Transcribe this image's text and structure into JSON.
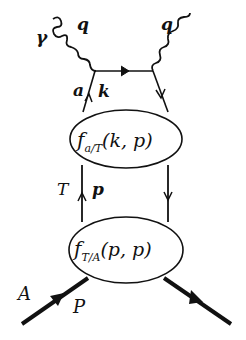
{
  "diagram": {
    "type": "feynman-diagram",
    "colors": {
      "line": "#111111",
      "background": "#ffffff"
    },
    "labels": {
      "photon": "γ",
      "photon_momentum_in": "q",
      "photon_momentum_out": "q",
      "parton": "a",
      "parton_momentum": "k",
      "intermediate": "T",
      "intermediate_momentum": "p",
      "hadron": "A",
      "hadron_momentum": "P"
    },
    "blobs": [
      {
        "name": "upper-blob",
        "func": "f",
        "sub": "a/T",
        "args": "(k, p)"
      },
      {
        "name": "lower-blob",
        "func": "f",
        "sub": "T/A",
        "args": "(p, p)"
      }
    ]
  }
}
